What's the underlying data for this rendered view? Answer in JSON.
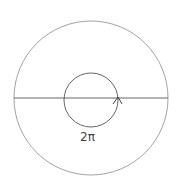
{
  "diagram": {
    "outer_circle": {
      "cx": 91,
      "cy": 98,
      "r": 77,
      "stroke": "#888888"
    },
    "inner_circle": {
      "cx": 91,
      "cy": 100,
      "r": 27,
      "stroke": "#555555"
    },
    "diameter_line": {
      "x1": 14,
      "y1": 98,
      "x2": 168,
      "y2": 98,
      "stroke": "#555555"
    },
    "arrow": {
      "direction": "counterclockwise-up"
    },
    "label": "2π"
  }
}
